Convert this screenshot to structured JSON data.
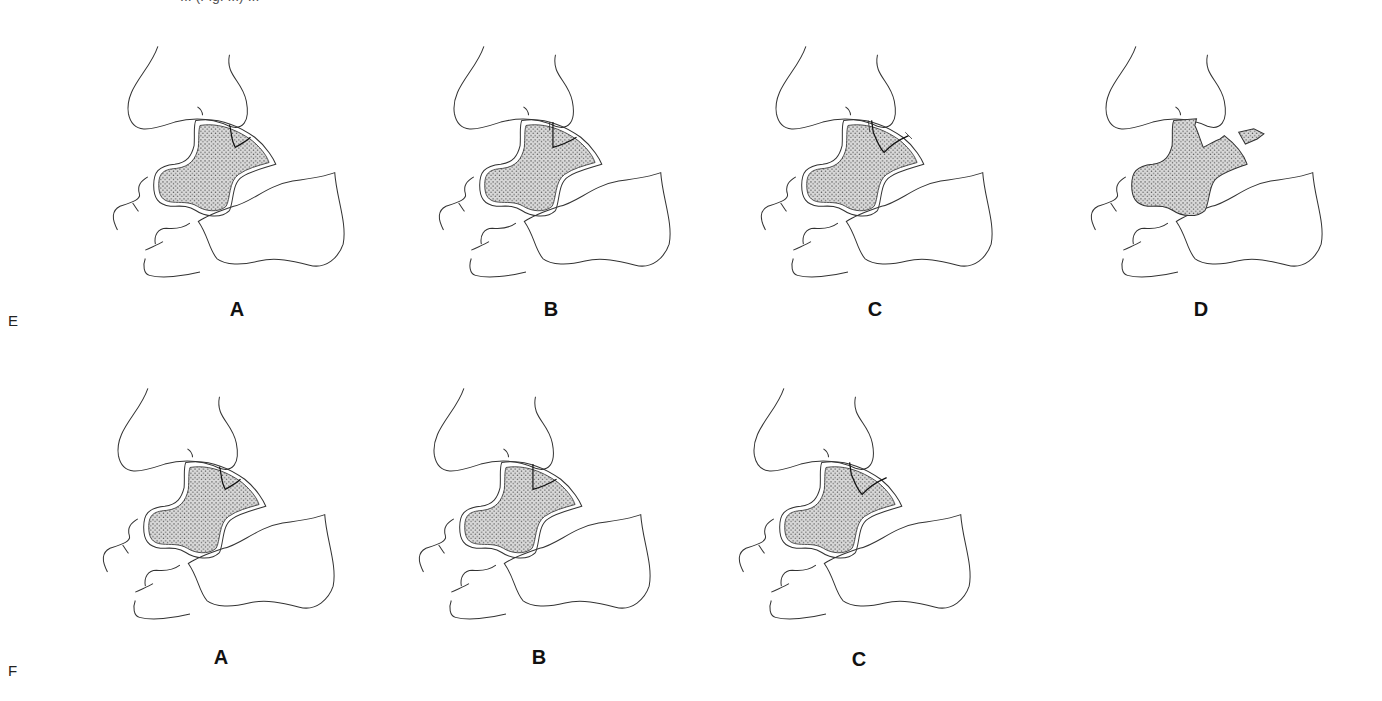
{
  "figure": {
    "caption_fragment": "... (Fig. ...) ...",
    "rows": [
      {
        "label": "E",
        "panels": [
          {
            "label": "A",
            "stage": "crack"
          },
          {
            "label": "B",
            "stage": "partial-fragment"
          },
          {
            "label": "C",
            "stage": "complete-fragment"
          },
          {
            "label": "D",
            "stage": "displaced-fragment"
          }
        ]
      },
      {
        "label": "F",
        "panels": [
          {
            "label": "A",
            "stage": "crack"
          },
          {
            "label": "B",
            "stage": "partial-fragment"
          },
          {
            "label": "C",
            "stage": "complete-fragment"
          }
        ]
      }
    ]
  },
  "colors": {
    "line": "#333333",
    "stipple": "#555555",
    "background": "#ffffff"
  }
}
